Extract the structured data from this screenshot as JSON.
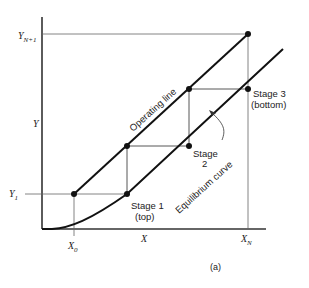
{
  "figure": {
    "caption": "(a)",
    "axes": {
      "y_label": "Y",
      "x_label": "X",
      "y_ticks": [
        {
          "main": "Y",
          "sub": "N+1"
        },
        {
          "main": "Y",
          "sub": "1"
        }
      ],
      "x_ticks": [
        {
          "main": "X",
          "sub": "0"
        },
        {
          "main": "X",
          "sub": "N"
        }
      ]
    },
    "curves": {
      "operating_line": "Operating line",
      "equilibrium_curve": "Equilibrium curve"
    },
    "stages": [
      {
        "label": "Stage 1",
        "sub": "(top)"
      },
      {
        "label": "Stage",
        "sub": "2"
      },
      {
        "label": "Stage 3",
        "sub": "(bottom)"
      }
    ],
    "colors": {
      "line": "#111111",
      "thin_line": "#555555"
    }
  }
}
